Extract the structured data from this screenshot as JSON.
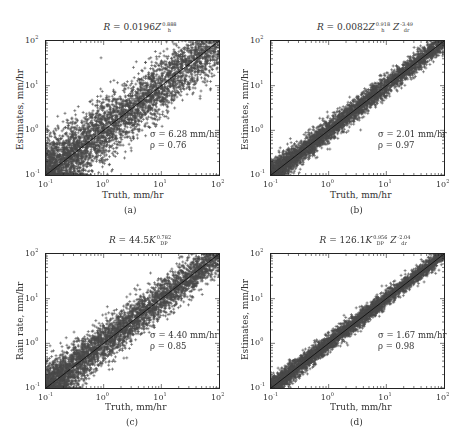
{
  "figure": {
    "panels": [
      {
        "id": "a",
        "caption": "(a)",
        "title": {
          "prefix": "R = 0.0196",
          "terms": [
            {
              "var": "Z",
              "sub": "h",
              "sup": "0.888"
            }
          ]
        },
        "xlabel": "Truth, mm/hr",
        "ylabel": "Estimates, mm/hr",
        "sigma": "σ = 6.28 mm/hr",
        "rho": "ρ = 0.76"
      },
      {
        "id": "b",
        "caption": "(b)",
        "title": {
          "prefix": "R = 0.0082",
          "terms": [
            {
              "var": "Z",
              "sub": "h",
              "sup": "0.918"
            },
            {
              "var": "Z",
              "sub": "dr",
              "sup": "-3.49"
            }
          ]
        },
        "xlabel": "Truth, mm/hr",
        "ylabel": "Estimates, mm/hr",
        "sigma": "σ = 2.01 mm/hr",
        "rho": "ρ = 0.97"
      },
      {
        "id": "c",
        "caption": "(c)",
        "title": {
          "prefix": "R = 44.5",
          "terms": [
            {
              "var": "K",
              "sub": "DP",
              "sup": "0.782"
            }
          ]
        },
        "xlabel": "Truth, mm/hr",
        "ylabel": "Rain rate, mm/hr",
        "sigma": "σ = 4.40 mm/hr",
        "rho": "ρ = 0.85"
      },
      {
        "id": "d",
        "caption": "(d)",
        "title": {
          "prefix": "R = 126.1",
          "terms": [
            {
              "var": "K",
              "sub": "DP",
              "sup": "0.956"
            },
            {
              "var": "Z",
              "sub": "dr",
              "sup": "-2.04"
            }
          ]
        },
        "xlabel": "Truth, mm/hr",
        "ylabel": "Estimates, mm/hr",
        "sigma": "σ = 1.67 mm/hr",
        "rho": "ρ = 0.98"
      }
    ],
    "tick_labels": {
      "x": [
        {
          "base": "10",
          "exp": "-1"
        },
        {
          "base": "10",
          "exp": "0"
        },
        {
          "base": "10",
          "exp": "1"
        },
        {
          "base": "10",
          "exp": "2"
        }
      ],
      "y": [
        {
          "base": "10",
          "exp": "2"
        },
        {
          "base": "10",
          "exp": "1"
        },
        {
          "base": "10",
          "exp": "0"
        },
        {
          "base": "10",
          "exp": "-1"
        }
      ]
    },
    "colors": {
      "marker": "#4a4a4a",
      "line": "#111111",
      "axis": "#222222"
    }
  },
  "chart_data": [
    {
      "type": "scatter",
      "panel": "a",
      "title": "R = 0.0196 Z_h^0.888",
      "xlabel": "Truth, mm/hr",
      "ylabel": "Estimates, mm/hr",
      "xscale": "log",
      "yscale": "log",
      "xlim": [
        0.1,
        100
      ],
      "ylim": [
        0.1,
        100
      ],
      "xticks": [
        "10^-1",
        "10^0",
        "10^1",
        "10^2"
      ],
      "yticks": [
        "10^-1",
        "10^0",
        "10^1",
        "10^2"
      ],
      "reference_line": "1:1",
      "marker": "+",
      "annotations": [
        "σ = 6.28 mm/hr",
        "ρ = 0.76"
      ],
      "stats": {
        "sigma_mm_hr": 6.28,
        "rho": 0.76
      },
      "spread_log10": 0.3,
      "grid": false,
      "legend": null
    },
    {
      "type": "scatter",
      "panel": "b",
      "title": "R = 0.0082 Z_h^0.918 Z_dr^-3.49",
      "xlabel": "Truth, mm/hr",
      "ylabel": "Estimates, mm/hr",
      "xscale": "log",
      "yscale": "log",
      "xlim": [
        0.1,
        100
      ],
      "ylim": [
        0.1,
        100
      ],
      "xticks": [
        "10^-1",
        "10^0",
        "10^1",
        "10^2"
      ],
      "yticks": [
        "10^-1",
        "10^0",
        "10^1",
        "10^2"
      ],
      "reference_line": "1:1",
      "marker": "+",
      "annotations": [
        "σ = 2.01 mm/hr",
        "ρ = 0.97"
      ],
      "stats": {
        "sigma_mm_hr": 2.01,
        "rho": 0.97
      },
      "spread_log10": 0.11,
      "grid": false,
      "legend": null
    },
    {
      "type": "scatter",
      "panel": "c",
      "title": "R = 44.5 K_DP^0.782",
      "xlabel": "Truth, mm/hr",
      "ylabel": "Rain rate, mm/hr",
      "xscale": "log",
      "yscale": "log",
      "xlim": [
        0.1,
        100
      ],
      "ylim": [
        0.1,
        100
      ],
      "xticks": [
        "10^-1",
        "10^0",
        "10^1",
        "10^2"
      ],
      "yticks": [
        "10^-1",
        "10^0",
        "10^1",
        "10^2"
      ],
      "reference_line": "1:1",
      "marker": "+",
      "annotations": [
        "σ = 4.40 mm/hr",
        "ρ = 0.85"
      ],
      "stats": {
        "sigma_mm_hr": 4.4,
        "rho": 0.85
      },
      "spread_log10": 0.2,
      "grid": false,
      "legend": null
    },
    {
      "type": "scatter",
      "panel": "d",
      "title": "R = 126.1 K_DP^0.956 Z_dr^-2.04",
      "xlabel": "Truth, mm/hr",
      "ylabel": "Estimates, mm/hr",
      "xscale": "log",
      "yscale": "log",
      "xlim": [
        0.1,
        100
      ],
      "ylim": [
        0.1,
        100
      ],
      "xticks": [
        "10^-1",
        "10^0",
        "10^1",
        "10^2"
      ],
      "yticks": [
        "10^-1",
        "10^0",
        "10^1",
        "10^2"
      ],
      "reference_line": "1:1",
      "marker": "+",
      "annotations": [
        "σ = 1.67 mm/hr",
        "ρ = 0.98"
      ],
      "stats": {
        "sigma_mm_hr": 1.67,
        "rho": 0.98
      },
      "spread_log10": 0.09,
      "grid": false,
      "legend": null
    }
  ]
}
